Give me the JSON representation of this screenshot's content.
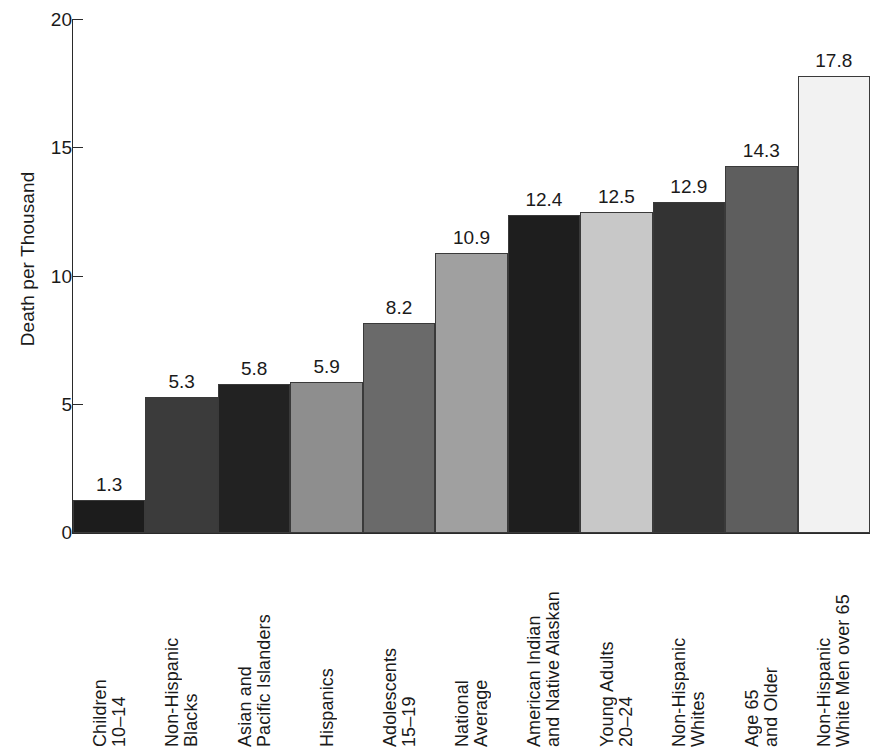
{
  "chart_data": {
    "type": "bar",
    "title": "",
    "xlabel": "",
    "ylabel": "Death per Thousand",
    "ylim": [
      0,
      20
    ],
    "yticks": [
      0,
      5,
      10,
      15,
      20
    ],
    "ytick_labels": [
      "0",
      "5",
      "10",
      "15",
      "20"
    ],
    "grid": false,
    "legend": "none",
    "categories": [
      "Children 10–14",
      "Non-Hispanic Blacks",
      "Asian and Pacific Islanders",
      "Hispanics",
      "Adolescents 15–19",
      "National Average",
      "American Indian and Native Alaskan",
      "Young Adults 20–24",
      "Non-Hispanic Whites",
      "Age 65 and Older",
      "Non-Hispanic White Men over 65"
    ],
    "category_lines": [
      [
        "Children",
        "10–14"
      ],
      [
        "Non-Hispanic",
        "Blacks"
      ],
      [
        "Asian and",
        "Pacific Islanders"
      ],
      [
        "Hispanics",
        ""
      ],
      [
        "Adolescents",
        "15–19"
      ],
      [
        "National",
        "Average"
      ],
      [
        "American Indian",
        "and Native Alaskan"
      ],
      [
        "Young Adults",
        "20–24"
      ],
      [
        "Non-Hispanic",
        "Whites"
      ],
      [
        "Age 65",
        "and Older"
      ],
      [
        "Non-Hispanic",
        "White Men over 65"
      ]
    ],
    "values": [
      1.3,
      5.3,
      5.8,
      5.9,
      8.2,
      10.9,
      12.4,
      12.5,
      12.9,
      14.3,
      17.8
    ],
    "value_labels": [
      "1.3",
      "5.3",
      "5.8",
      "5.9",
      "8.2",
      "10.9",
      "12.4",
      "12.5",
      "12.9",
      "14.3",
      "17.8"
    ],
    "bar_colors": [
      "#1c1c1c",
      "#3b3b3b",
      "#222222",
      "#8e8e8e",
      "#6a6a6a",
      "#a0a0a0",
      "#1e1e1e",
      "#c8c8c8",
      "#333333",
      "#5e5e5e",
      "#f2f2f2"
    ],
    "bar_border_color": "#3a3a3a"
  },
  "axis": {
    "y_title": "Death per Thousand",
    "y_tick_0": "0",
    "y_tick_1": "5",
    "y_tick_2": "10",
    "y_tick_3": "15",
    "y_tick_4": "20"
  }
}
